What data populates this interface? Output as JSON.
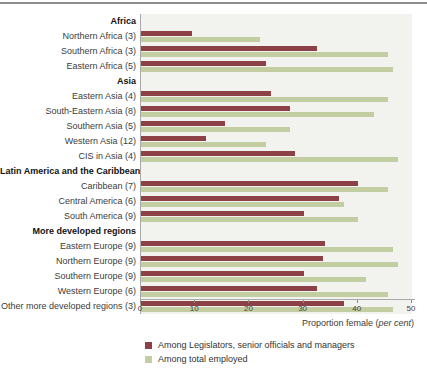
{
  "colors": {
    "plot_background": "#f2f2ee",
    "axis_line": "#a9a9a9",
    "top_rule": "#8d8d8d",
    "series_legislators": "#8c4146",
    "series_total_employed": "#c3cda2"
  },
  "chart_data": {
    "type": "bar",
    "orientation": "horizontal",
    "xlabel_prefix": "Proportion female (",
    "xlabel_italic": "per cent",
    "xlabel_suffix": ")",
    "xlim": [
      0,
      50
    ],
    "xticks": [
      0,
      10,
      20,
      30,
      40,
      50
    ],
    "grid": false,
    "legend_position": "bottom-left",
    "legend": [
      {
        "label": "Among Legislators, senior officials and managers",
        "color": "#8c4146"
      },
      {
        "label": "Among total employed",
        "color": "#c3cda2"
      }
    ],
    "groups": [
      {
        "header": "Africa",
        "rows": [
          {
            "label": "Northern Africa (3)",
            "values": [
              9.5,
              22
            ]
          },
          {
            "label": "Southern Africa (3)",
            "values": [
              32.5,
              45.5
            ]
          },
          {
            "label": "Eastern Africa (5)",
            "values": [
              23,
              46.5
            ]
          }
        ]
      },
      {
        "header": "Asia",
        "rows": [
          {
            "label": "Eastern Asia (4)",
            "values": [
              24,
              45.5
            ]
          },
          {
            "label": "South-Eastern Asia (8)",
            "values": [
              27.5,
              43
            ]
          },
          {
            "label": "Southern Asia (5)",
            "values": [
              15.5,
              27.5
            ]
          },
          {
            "label": "Western Asia (12)",
            "values": [
              12,
              23
            ]
          },
          {
            "label": "CIS in Asia (4)",
            "values": [
              28.5,
              47.5
            ]
          }
        ]
      },
      {
        "header": "Latin America and the Caribbean",
        "rows": [
          {
            "label": "Caribbean (7)",
            "values": [
              40,
              45.5
            ]
          },
          {
            "label": "Central America (6)",
            "values": [
              36.5,
              37.5
            ]
          },
          {
            "label": "South America (9)",
            "values": [
              30,
              40
            ]
          }
        ]
      },
      {
        "header": "More developed regions",
        "rows": [
          {
            "label": "Eastern Europe (9)",
            "values": [
              34,
              46.5
            ]
          },
          {
            "label": "Northern Europe (9)",
            "values": [
              33.5,
              47.5
            ]
          },
          {
            "label": "Southern Europe (9)",
            "values": [
              30,
              41.5
            ]
          },
          {
            "label": "Western Europe (6)",
            "values": [
              32.5,
              45.5
            ]
          },
          {
            "label": "Other more developed regions (3)",
            "values": [
              37.5,
              46.5
            ]
          }
        ]
      }
    ]
  }
}
